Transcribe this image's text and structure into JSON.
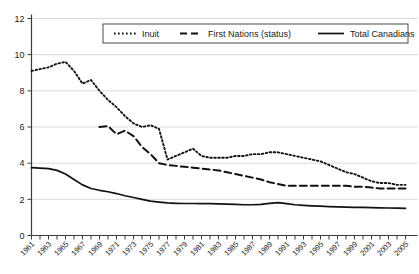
{
  "chart_data": {
    "type": "line",
    "title": "",
    "subtitle": "",
    "xlabel": "",
    "ylabel": "",
    "xlim": [
      1961,
      2005
    ],
    "ylim": [
      0,
      12
    ],
    "yticks": [
      0,
      2,
      4,
      6,
      8,
      10,
      12
    ],
    "grid": true,
    "legend_position": "top-center",
    "x": [
      1961,
      1962,
      1963,
      1964,
      1965,
      1966,
      1967,
      1968,
      1969,
      1970,
      1971,
      1972,
      1973,
      1974,
      1975,
      1976,
      1977,
      1978,
      1979,
      1980,
      1981,
      1982,
      1983,
      1984,
      1985,
      1986,
      1987,
      1988,
      1989,
      1990,
      1991,
      1992,
      1993,
      1994,
      1995,
      1996,
      1997,
      1998,
      1999,
      2000,
      2001,
      2002,
      2003,
      2004,
      2005
    ],
    "xtick_labels": [
      "1961",
      "1963",
      "1965",
      "1967",
      "1969",
      "1971",
      "1973",
      "1975",
      "1977",
      "1979",
      "1981",
      "1983",
      "1985",
      "1987",
      "1989",
      "1991",
      "1993",
      "1995",
      "1997",
      "1999",
      "2001",
      "2003",
      "2005"
    ],
    "series": [
      {
        "name": "Inuit",
        "style": "dotted",
        "color": "#111111",
        "values": [
          9.1,
          9.2,
          9.3,
          9.5,
          9.6,
          9.1,
          8.4,
          8.6,
          8.0,
          7.5,
          7.1,
          6.6,
          6.2,
          6.0,
          6.1,
          5.9,
          4.2,
          4.4,
          4.6,
          4.8,
          4.4,
          4.3,
          4.3,
          4.3,
          4.4,
          4.4,
          4.5,
          4.5,
          4.6,
          4.6,
          4.5,
          4.4,
          4.3,
          4.2,
          4.1,
          3.9,
          3.7,
          3.5,
          3.4,
          3.2,
          3.0,
          2.9,
          2.9,
          2.8,
          2.8
        ]
      },
      {
        "name": "First Nations (status)",
        "style": "dashed",
        "color": "#111111",
        "values": [
          null,
          null,
          null,
          null,
          null,
          null,
          null,
          null,
          6.0,
          6.05,
          5.6,
          5.8,
          5.5,
          4.9,
          4.5,
          4.0,
          3.9,
          3.85,
          3.8,
          3.75,
          3.7,
          3.65,
          3.6,
          3.5,
          3.4,
          3.3,
          3.2,
          3.1,
          2.95,
          2.85,
          2.75,
          2.75,
          2.75,
          2.75,
          2.75,
          2.75,
          2.75,
          2.75,
          2.7,
          2.7,
          2.65,
          2.6,
          2.6,
          2.6,
          2.6
        ]
      },
      {
        "name": "Total Canadians",
        "style": "solid",
        "color": "#111111",
        "values": [
          3.75,
          3.73,
          3.7,
          3.6,
          3.4,
          3.1,
          2.8,
          2.6,
          2.5,
          2.42,
          2.32,
          2.2,
          2.1,
          2.0,
          1.9,
          1.85,
          1.8,
          1.78,
          1.77,
          1.77,
          1.76,
          1.76,
          1.75,
          1.74,
          1.72,
          1.7,
          1.7,
          1.72,
          1.78,
          1.82,
          1.76,
          1.7,
          1.67,
          1.64,
          1.62,
          1.6,
          1.58,
          1.57,
          1.56,
          1.55,
          1.54,
          1.53,
          1.52,
          1.51,
          1.5
        ]
      }
    ]
  },
  "legend": {
    "items": [
      {
        "label": "Inuit",
        "style": "dotted"
      },
      {
        "label": "First Nations (status)",
        "style": "dashed"
      },
      {
        "label": "Total Canadians",
        "style": "solid"
      }
    ]
  }
}
